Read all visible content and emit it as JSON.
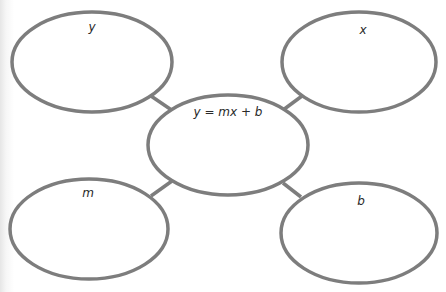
{
  "diagram": {
    "type": "concept-web",
    "stroke_color": "#7d7d7d",
    "center": {
      "label": "y = mx + b"
    },
    "nodes": [
      {
        "id": "top-left",
        "label": "y"
      },
      {
        "id": "top-right",
        "label": "x"
      },
      {
        "id": "bottom-left",
        "label": "m"
      },
      {
        "id": "bottom-right",
        "label": "b"
      }
    ]
  }
}
